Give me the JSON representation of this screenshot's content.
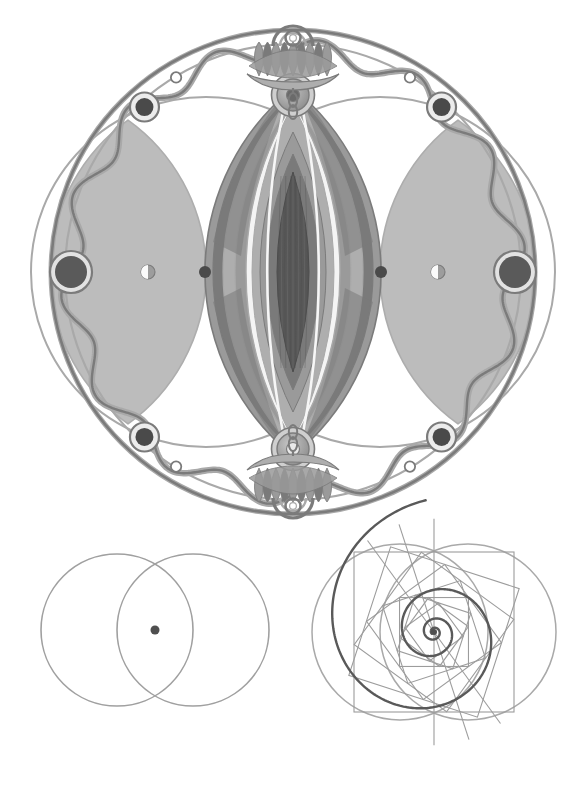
{
  "page": {
    "title": "Sacred Geometry Plate",
    "width": 586,
    "height": 811,
    "background": "#ffffff",
    "medium": "pencil-and-gray-wash-illustration"
  },
  "palette": {
    "paper": "#ffffff",
    "line_dark": "#4d4d4d",
    "line_mid": "#7b7b7b",
    "line_light": "#a9a9a9",
    "line_faint": "#bdbdbd",
    "fill_pale": "#b9b9b9",
    "fill_light": "#aeaeae",
    "fill_mid": "#9a9a9a",
    "fill_dark": "#7a7a7a",
    "fill_darker": "#666666",
    "fill_deepest": "#575757",
    "node_dark": "#4a4a4a",
    "highlight": "#f4f4f4",
    "spiral_ink": "#595959",
    "construction_line": "#9c9c9c"
  },
  "figures": [
    {
      "id": "mandala",
      "name": "vesica-mandala",
      "caption": "",
      "center": {
        "x": 293,
        "y": 272
      },
      "outer_radius": 242,
      "inner_ring_radius": 228,
      "elements": {
        "outer_circle": {
          "radius": 242,
          "stroke": "#7b7b7b",
          "stroke_width": 3.2
        },
        "secondary_circle": {
          "radius": 228,
          "stroke": "#8d8d8d",
          "stroke_width": 2.0
        },
        "wavy_band": {
          "lobes": 14,
          "amplitude": 11,
          "mean_radius": 222,
          "stroke": "#8a8a8a",
          "stroke_width": 5.5
        },
        "vesica_circles": {
          "count": 2,
          "radius": 175,
          "offset_x": 87
        },
        "side_lens_fill": "#b2b2b2",
        "center_lens_layers": 9,
        "corner_nodes": {
          "count": 4,
          "radius": 9,
          "fill": "#4a4a4a",
          "ring": "#ffffff"
        },
        "side_nodes": {
          "count": 2,
          "radius": 16,
          "fill": "#5a5a5a",
          "ring": "#d9d9d9"
        },
        "axis_dots": {
          "count": 2,
          "radius": 6,
          "fill": "#4a4a4a"
        },
        "half_moons": {
          "count": 2,
          "radius": 7
        },
        "top_ornament": "lotus-crown-with-ring-and-chain",
        "bottom_ornament": "lotus-crown-with-ring-and-chain",
        "hub_circles": {
          "count": 2,
          "radius": 19,
          "fill": "#8e8e8e",
          "core": "#5e5e5e"
        }
      }
    },
    {
      "id": "vesica",
      "name": "vesica-piscis-construction",
      "caption": "",
      "center": {
        "x": 155,
        "y": 630
      },
      "circle_radius": 76,
      "circle_offset_x": 38,
      "stroke": "#a0a0a0",
      "stroke_width": 1.6,
      "center_dot": {
        "x": 155,
        "y": 630,
        "radius": 4.5,
        "fill": "#4f4f4f"
      }
    },
    {
      "id": "spiral",
      "name": "golden-spiral-construction",
      "caption": "",
      "center": {
        "x": 434,
        "y": 632
      },
      "square_side": 160,
      "square_count": 9,
      "rotation_step_deg": 18,
      "shrink_ratio": 0.845,
      "circles": [
        {
          "cx": 400,
          "cy": 632,
          "r": 88
        },
        {
          "cx": 468,
          "cy": 632,
          "r": 88
        }
      ],
      "spiral": {
        "type": "logarithmic",
        "growth_b": 0.1835,
        "turns": 3.35,
        "stroke": "#595959",
        "stroke_width": 2.4,
        "start_point": {
          "x": 403,
          "y": 508
        },
        "end_point": {
          "x": 470,
          "y": 764
        }
      },
      "construction_stroke": "#9c9c9c",
      "construction_width": 1.1
    }
  ],
  "annotations": {
    "has_text_labels": false,
    "label_count": 0
  }
}
